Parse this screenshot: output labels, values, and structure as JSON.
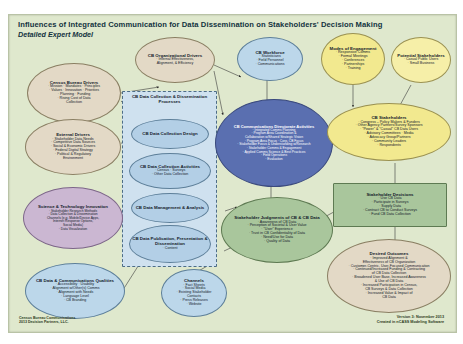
{
  "header": {
    "title": "Influences of Integrated Communication for Data Dissemination on Stakeholders' Decision Making",
    "subtitle": "Detailed Expert Model"
  },
  "footer": {
    "left_line1": "Census Bureau Communications",
    "left_line2": "2013 Decision Partners, LLC.",
    "right_line1": "Version 3: November 2013",
    "right_line2": "Created in nCASS Modeling Software"
  },
  "panel": {
    "label": "CB Data Collection & Dissemination Processes"
  },
  "nodes": [
    {
      "id": "census-bureau-drivers",
      "title": "Census Bureau Drivers",
      "items": [
        "· Mission · Mandates · Principles",
        "· Values · Innovation · Priorities",
        "· Planning · Funding",
        "· Rising Cost of Data",
        "Collection"
      ]
    },
    {
      "id": "external-drivers",
      "title": "External Drivers",
      "items": [
        "· Stakeholder Data Needs",
        "· Competitive Data Sources",
        "· Social & Economic Drivers",
        "· Federal Digital Strategy",
        "· Political & Regulatory",
        "Environment"
      ]
    },
    {
      "id": "science-technology-innovation",
      "title": "Science & Technology Innovation",
      "items": [
        "· Stakeholder Research Methods",
        "· Data Collection & Dissemination",
        "Channels (e.g. Mobile/Device Apps,",
        "Internet Response Options,",
        "Social Media)",
        "· Data Visualization"
      ]
    },
    {
      "id": "cb-data-communications-qualities",
      "title": "CB Data & Communications Qualities",
      "items": [
        "· Accessibility · Usability",
        "· Alignment w/Other(s) Comms",
        "· Alignment with Needs",
        "· Language Level",
        "· CB Branding"
      ]
    },
    {
      "id": "cb-organizational-drivers",
      "title": "CB Organizational Drivers",
      "items": [
        "· Internal Effectiveness,",
        "Alignment, & Efficiency"
      ]
    },
    {
      "id": "cb-workforce",
      "title": "CB Workforce",
      "items": [
        "· Statisticians",
        "· Field Personnel",
        "· Communications"
      ]
    },
    {
      "id": "modes-of-engagement",
      "title": "Modes of Engagement",
      "items": [
        "· Responsive Comms",
        "· Formal Meetings",
        "· Conferences",
        "· Partnerships",
        "· Training"
      ]
    },
    {
      "id": "potential-stakeholders",
      "title": "Potential Stakeholders",
      "items": [
        "· Casual Public Users",
        "· Small Business"
      ]
    },
    {
      "id": "cb-data-collection-design",
      "title": "CB Data Collection Design",
      "items": []
    },
    {
      "id": "cb-data-collection-activities",
      "title": "CB Data Collection Activities",
      "items": [
        "· Census · Surveys",
        "· Other Data Collection"
      ]
    },
    {
      "id": "cb-data-management-analysis",
      "title": "CB Data Management & Analysis",
      "items": []
    },
    {
      "id": "cb-data-publication",
      "title": "CB Data Publication, Presentation & Dissemination",
      "items": [
        "· Content"
      ]
    },
    {
      "id": "channels",
      "title": "Channels",
      "items": [
        "· Fact Sheets",
        "· Social Media",
        "· Existing Stakeholder",
        "Contacts",
        "· Press Releases",
        "· Website"
      ]
    },
    {
      "id": "cb-communications-directorate-activities",
      "title": "CB Communications Directorate Activities",
      "items": [
        "· Integrated Comms Planning",
        "· Program Area Coordination &",
        "Collaboration w/Shared Strategic Vision",
        "· Program Area Focus · Corp. CB Focus",
        "· Stakeholder Focus & Understanding w/Research",
        "· Stakeholder Comms & Engagement",
        "· Applied Comms Science & Best Practices",
        "· Field Operations",
        "· Evaluation"
      ]
    },
    {
      "id": "stakeholder-judgments",
      "title": "Stakeholder Judgments of CB & CB Data",
      "items": [
        "· Awareness of CB Data",
        "· Perception of Societal & User Value",
        "· \"User\" Experience",
        "· Trust in CB Confidentiality of Data",
        "· Need/Use for Data",
        "· Quality of Data"
      ]
    },
    {
      "id": "cb-stakeholders",
      "title": "CB Stakeholders",
      "items": [
        "· Congress – Policy Makers & Funders",
        "· Other Agency Partners/Survey Sponsors",
        "· \"Power\" & \"Casual\" CB Data Users",
        "· Advisory Committees · Media",
        "· Advocacy Group/Partners",
        "· Community Leaders",
        "· Respondents"
      ]
    },
    {
      "id": "stakeholder-decisions",
      "title": "Stakeholder Decisions",
      "items": [
        "· Use CB Data",
        "· Participate in Surveys",
        "· Supply Data",
        "· Contract CB to Conduct Surveys",
        "· Fund CB Data Collection"
      ]
    },
    {
      "id": "desired-outcomes",
      "title": "Desired Outcomes",
      "items": [
        "· Improved Alignment &",
        "Effectiveness of CB Organization",
        "· Customer-Centric, User-Focused Communication",
        "· Continued/Increased Funding & Contracting",
        "of CB Data Collection",
        "· Broadened User Base, Increased Awareness",
        "& Use of CB Data",
        "· Increased Participation in Census,",
        "CB Surveys & Data Collection",
        "· Increased Value & Impact of",
        "CB Data"
      ]
    }
  ]
}
